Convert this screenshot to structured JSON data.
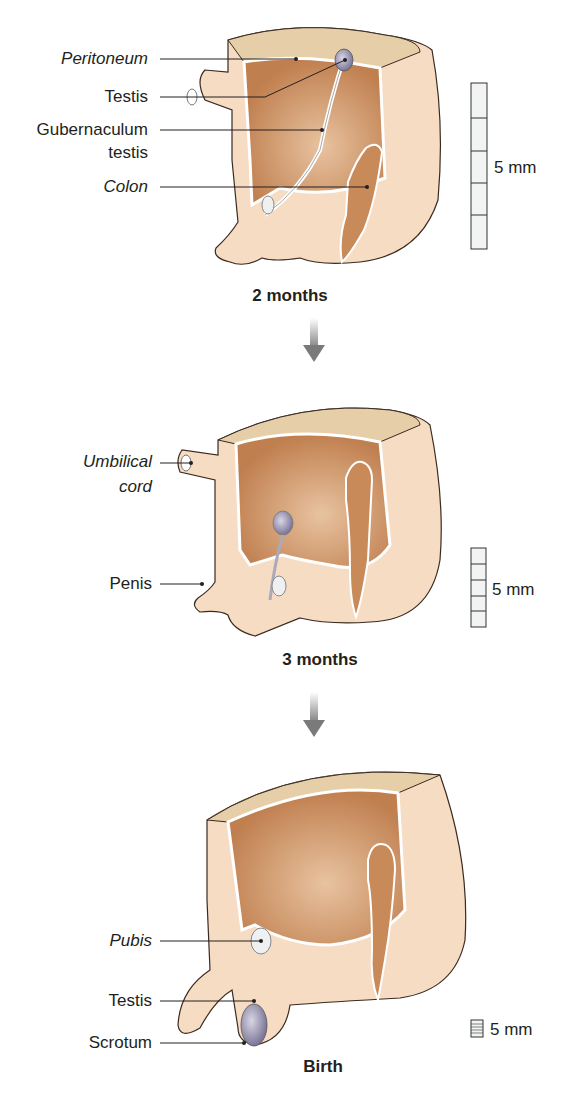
{
  "panels": [
    {
      "stage": "2 months",
      "labels": [
        {
          "text": "Peritoneum",
          "italic": true
        },
        {
          "text": "Testis",
          "italic": false
        },
        {
          "text": "Gubernaculum",
          "italic": false
        },
        {
          "text": "testis",
          "italic": false
        },
        {
          "text": "Colon",
          "italic": true
        }
      ],
      "scale": "5 mm"
    },
    {
      "stage": "3 months",
      "labels": [
        {
          "text": "Umbilical",
          "italic": true
        },
        {
          "text": "cord",
          "italic": true
        },
        {
          "text": "Penis",
          "italic": false
        }
      ],
      "scale": "5 mm"
    },
    {
      "stage": "Birth",
      "labels": [
        {
          "text": "Pubis",
          "italic": true
        },
        {
          "text": "Testis",
          "italic": false
        },
        {
          "text": "Scrotum",
          "italic": false
        }
      ],
      "scale": "5 mm"
    }
  ],
  "colors": {
    "skin": "#f7dcc4",
    "cavity": "#c98a5a",
    "cut_top": "#e6cfa8",
    "testis": "#9a95b0",
    "arrow": "#7a7a7a"
  }
}
